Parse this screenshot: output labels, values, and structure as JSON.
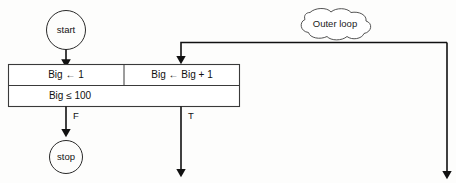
{
  "diagram": {
    "type": "flowchart",
    "background_color": "#fdfdfc",
    "line_color": "#111111",
    "nodes": {
      "start": {
        "label": "start",
        "shape": "circle"
      },
      "stop": {
        "label": "stop",
        "shape": "circle"
      },
      "init_cell": {
        "label": "Big ← 1"
      },
      "increment_cell": {
        "label": "Big ← Big + 1"
      },
      "condition_cell": {
        "label": "Big ≤ 100"
      }
    },
    "labels": {
      "false_branch": "F",
      "true_branch": "T"
    },
    "callout": {
      "label": "Outer loop",
      "shape": "cloud"
    }
  }
}
